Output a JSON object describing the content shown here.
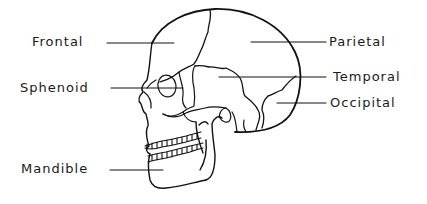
{
  "diagram": {
    "labels": {
      "frontal": "Frontal",
      "sphenoid": "Sphenoid",
      "mandible": "Mandible",
      "parietal": "Parietal",
      "temporal": "Temporal",
      "occipital": "Occipital"
    }
  }
}
